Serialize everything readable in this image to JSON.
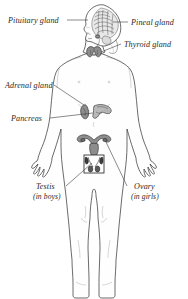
{
  "figure": {
    "background_color": "#ffffff",
    "line_color": "#3a3a3a",
    "label_color": "#2a2a2a",
    "width": 188,
    "height": 299
  },
  "labels": {
    "pituitary": "Pituitary gland",
    "pineal": "Pineal gland",
    "thyroid": "Thyroid gland",
    "adrenal": "Adrenal gland",
    "pancreas": "Pancreas",
    "testis": "Testis",
    "testis_note": "(in boys)",
    "ovary": "Ovary",
    "ovary_note": "(in girls)"
  },
  "parts": [
    {
      "name": "brain",
      "label": "Pineal gland"
    },
    {
      "name": "pituitary-gland",
      "label": "Pituitary gland"
    },
    {
      "name": "thyroid-gland",
      "label": "Thyroid gland"
    },
    {
      "name": "adrenal-gland",
      "label": "Adrenal gland"
    },
    {
      "name": "pancreas",
      "label": "Pancreas"
    },
    {
      "name": "ovary",
      "label": "Ovary"
    },
    {
      "name": "testis",
      "label": "Testis"
    }
  ]
}
